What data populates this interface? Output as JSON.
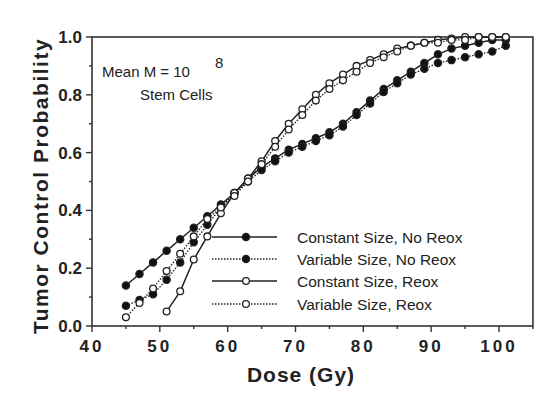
{
  "chart_data": {
    "type": "line",
    "title": "",
    "xlabel": "Dose (Gy)",
    "ylabel": "Tumor Control Probability",
    "xlim": [
      40,
      105
    ],
    "ylim": [
      0.0,
      1.0
    ],
    "x_ticks": [
      40,
      50,
      60,
      70,
      80,
      90,
      100
    ],
    "x_tick_labels": [
      "40",
      "50",
      "60",
      "70",
      "80",
      "90",
      "100"
    ],
    "y_ticks": [
      0.0,
      0.2,
      0.4,
      0.6,
      0.8,
      1.0
    ],
    "y_tick_labels": [
      "0.0",
      "0.2",
      "0.4",
      "0.6",
      "0.8",
      "1.0"
    ],
    "grid": false,
    "legend_position": "lower right",
    "annotation": {
      "line1_prefix": "Mean  M  =  10",
      "line1_superscript": "8",
      "line2": "Stem  Cells"
    },
    "series": [
      {
        "name": "Constant Size, No Reox",
        "marker": "filled-circle",
        "line": "solid",
        "x": [
          45,
          47,
          49,
          51,
          53,
          55,
          57,
          59,
          61,
          63,
          65,
          67,
          69,
          71,
          73,
          75,
          77,
          79,
          81,
          83,
          85,
          87,
          89,
          91,
          93,
          95,
          97,
          99,
          101
        ],
        "values": [
          0.14,
          0.18,
          0.22,
          0.26,
          0.3,
          0.34,
          0.38,
          0.42,
          0.46,
          0.51,
          0.55,
          0.58,
          0.61,
          0.63,
          0.65,
          0.67,
          0.7,
          0.74,
          0.78,
          0.82,
          0.85,
          0.88,
          0.91,
          0.94,
          0.96,
          0.97,
          0.98,
          0.99,
          0.99
        ]
      },
      {
        "name": "Variable Size, No Reox",
        "marker": "filled-circle",
        "line": "dotted",
        "x": [
          45,
          47,
          49,
          51,
          53,
          55,
          57,
          59,
          61,
          63,
          65,
          67,
          69,
          71,
          73,
          75,
          77,
          79,
          81,
          83,
          85,
          87,
          89,
          91,
          93,
          95,
          97,
          99,
          101
        ],
        "values": [
          0.07,
          0.09,
          0.11,
          0.16,
          0.22,
          0.29,
          0.35,
          0.41,
          0.46,
          0.5,
          0.54,
          0.57,
          0.6,
          0.62,
          0.64,
          0.66,
          0.69,
          0.73,
          0.77,
          0.81,
          0.84,
          0.87,
          0.89,
          0.91,
          0.92,
          0.93,
          0.94,
          0.95,
          0.97
        ]
      },
      {
        "name": "Constant Size, Reox",
        "marker": "open-circle",
        "line": "solid",
        "x": [
          51,
          53,
          55,
          57,
          59,
          61,
          63,
          65,
          67,
          69,
          71,
          73,
          75,
          77,
          79,
          81,
          83,
          85,
          87,
          89,
          91,
          93,
          95,
          97,
          99,
          101
        ],
        "values": [
          0.05,
          0.12,
          0.23,
          0.31,
          0.39,
          0.46,
          0.51,
          0.57,
          0.64,
          0.7,
          0.75,
          0.8,
          0.84,
          0.87,
          0.9,
          0.92,
          0.94,
          0.96,
          0.97,
          0.98,
          0.99,
          0.995,
          1.0,
          1.0,
          1.0,
          1.0
        ]
      },
      {
        "name": "Variable Size, Reox",
        "marker": "open-circle",
        "line": "dotted",
        "x": [
          45,
          47,
          49,
          51,
          53,
          55,
          57,
          59,
          61,
          63,
          65,
          67,
          69,
          71,
          73,
          75,
          77,
          79,
          81,
          83,
          85,
          87,
          89,
          91,
          93,
          95,
          97,
          99,
          101
        ],
        "values": [
          0.03,
          0.08,
          0.13,
          0.19,
          0.25,
          0.31,
          0.37,
          0.41,
          0.45,
          0.5,
          0.56,
          0.62,
          0.68,
          0.73,
          0.78,
          0.82,
          0.85,
          0.88,
          0.91,
          0.93,
          0.95,
          0.97,
          0.98,
          0.98,
          0.99,
          0.99,
          1.0,
          1.0,
          1.0
        ]
      }
    ]
  }
}
